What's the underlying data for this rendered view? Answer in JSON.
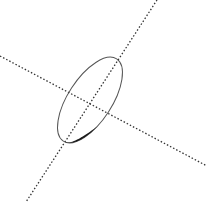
{
  "diagram": {
    "width": 212,
    "height": 211,
    "background": "#ffffff",
    "stroke_color": "#333333",
    "axes": [
      {
        "name": "steep-axis",
        "x1": 157,
        "y1": 0,
        "x2": 26,
        "y2": 202
      },
      {
        "name": "shallow-axis",
        "x1": 0,
        "y1": 56,
        "x2": 207,
        "y2": 166
      }
    ],
    "ellipse": {
      "cx": 90,
      "cy": 100,
      "rx": 49,
      "ry": 22,
      "rotation": -57,
      "thick_edge_color": "#1a1a1a"
    }
  }
}
